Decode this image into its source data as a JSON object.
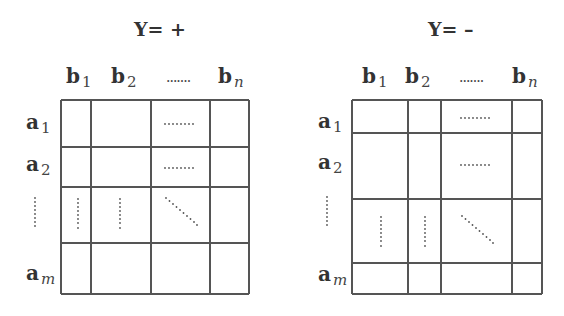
{
  "panels": [
    {
      "title": "Y= +",
      "col_labels": [
        {
          "base": "b",
          "sub": "1",
          "italic_sub": false
        },
        {
          "base": "b",
          "sub": "2",
          "italic_sub": false
        },
        {
          "base": "b",
          "sub": "n",
          "italic_sub": true
        }
      ],
      "col_ellipsis": ".......",
      "row_labels": [
        {
          "base": "a",
          "sub": "1",
          "italic_sub": false
        },
        {
          "base": "a",
          "sub": "2",
          "italic_sub": false
        },
        {
          "base": "a",
          "sub": "m",
          "italic_sub": true
        }
      ],
      "row_ellipsis": "vertical-dots",
      "grid": {
        "x_lines": [
          61,
          91,
          151,
          210,
          249
        ],
        "y_lines": [
          100,
          147,
          187,
          243,
          294
        ]
      },
      "cell_marks": [
        {
          "row": 0,
          "col": 2,
          "type": "horizontal-dots"
        },
        {
          "row": 1,
          "col": 2,
          "type": "horizontal-dots"
        },
        {
          "row": 2,
          "col": 0,
          "type": "vertical-dots"
        },
        {
          "row": 2,
          "col": 1,
          "type": "vertical-dots"
        },
        {
          "row": 2,
          "col": 2,
          "type": "diagonal-dots"
        }
      ]
    },
    {
      "title": "Y= –",
      "col_labels": [
        {
          "base": "b",
          "sub": "1",
          "italic_sub": false
        },
        {
          "base": "b",
          "sub": "2",
          "italic_sub": false
        },
        {
          "base": "b",
          "sub": "n",
          "italic_sub": true
        }
      ],
      "col_ellipsis": ".......",
      "row_labels": [
        {
          "base": "a",
          "sub": "1",
          "italic_sub": false
        },
        {
          "base": "a",
          "sub": "2",
          "italic_sub": false
        },
        {
          "base": "a",
          "sub": "m",
          "italic_sub": true
        }
      ],
      "row_ellipsis": "vertical-dots",
      "grid": {
        "x_lines": [
          352,
          408,
          441,
          512,
          542
        ],
        "y_lines": [
          100,
          133,
          199,
          263,
          294
        ]
      },
      "cell_marks": [
        {
          "row": 0,
          "col": 2,
          "type": "horizontal-dots"
        },
        {
          "row": 1,
          "col": 2,
          "type": "horizontal-dots"
        },
        {
          "row": 2,
          "col": 0,
          "type": "vertical-dots"
        },
        {
          "row": 2,
          "col": 1,
          "type": "vertical-dots"
        },
        {
          "row": 2,
          "col": 2,
          "type": "diagonal-dots"
        }
      ]
    }
  ],
  "colors": {
    "line": "#555555",
    "text": "#333333",
    "dots": "#555555"
  }
}
